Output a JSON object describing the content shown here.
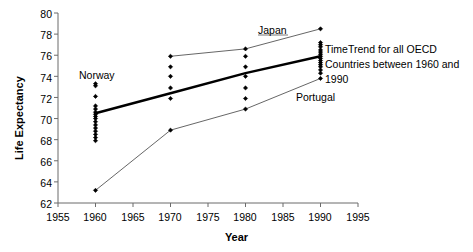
{
  "chart_data": {
    "type": "scatter",
    "title": "",
    "xlabel": "Year",
    "ylabel": "Life Expectancy",
    "xlim": [
      1955,
      1995
    ],
    "ylim": [
      62,
      80
    ],
    "xticks": [
      1955,
      1960,
      1965,
      1970,
      1975,
      1980,
      1985,
      1990,
      1995
    ],
    "yticks": [
      62,
      64,
      66,
      68,
      70,
      72,
      74,
      76,
      78,
      80
    ],
    "grid": false,
    "legend": "none",
    "annotations": [
      {
        "name": "japan",
        "text": "Japan",
        "x": 1985,
        "y": 78.6
      },
      {
        "name": "norway",
        "text": "Norway",
        "x": 1961,
        "y": 74.1
      },
      {
        "name": "portugal",
        "text": "Portugal",
        "x": 1988,
        "y": 72.2
      },
      {
        "name": "trend-note",
        "text": "TimeTrend for all OECD Countries between 1960 and 1990",
        "x": 1991,
        "y": 77.5
      }
    ],
    "series": [
      {
        "name": "OECD countries scatter",
        "type": "scatter",
        "marker": "diamond",
        "color": "#000000",
        "points": [
          {
            "x": 1960,
            "y": 73.3
          },
          {
            "x": 1960,
            "y": 73.1
          },
          {
            "x": 1960,
            "y": 72.1
          },
          {
            "x": 1960,
            "y": 71.2
          },
          {
            "x": 1960,
            "y": 70.9
          },
          {
            "x": 1960,
            "y": 70.6
          },
          {
            "x": 1960,
            "y": 70.4
          },
          {
            "x": 1960,
            "y": 70.2
          },
          {
            "x": 1960,
            "y": 70.0
          },
          {
            "x": 1960,
            "y": 69.7
          },
          {
            "x": 1960,
            "y": 69.4
          },
          {
            "x": 1960,
            "y": 69.1
          },
          {
            "x": 1960,
            "y": 68.8
          },
          {
            "x": 1960,
            "y": 68.5
          },
          {
            "x": 1960,
            "y": 68.2
          },
          {
            "x": 1960,
            "y": 67.9
          },
          {
            "x": 1960,
            "y": 63.2
          },
          {
            "x": 1970,
            "y": 75.9
          },
          {
            "x": 1970,
            "y": 74.9
          },
          {
            "x": 1970,
            "y": 74.0
          },
          {
            "x": 1970,
            "y": 72.9
          },
          {
            "x": 1970,
            "y": 71.9
          },
          {
            "x": 1970,
            "y": 68.9
          },
          {
            "x": 1980,
            "y": 76.6
          },
          {
            "x": 1980,
            "y": 75.9
          },
          {
            "x": 1980,
            "y": 74.9
          },
          {
            "x": 1980,
            "y": 74.0
          },
          {
            "x": 1980,
            "y": 72.9
          },
          {
            "x": 1980,
            "y": 71.9
          },
          {
            "x": 1980,
            "y": 70.9
          },
          {
            "x": 1990,
            "y": 78.5
          },
          {
            "x": 1990,
            "y": 77.2
          },
          {
            "x": 1990,
            "y": 77.0
          },
          {
            "x": 1990,
            "y": 76.8
          },
          {
            "x": 1990,
            "y": 76.5
          },
          {
            "x": 1990,
            "y": 76.3
          },
          {
            "x": 1990,
            "y": 76.1
          },
          {
            "x": 1990,
            "y": 75.9
          },
          {
            "x": 1990,
            "y": 75.7
          },
          {
            "x": 1990,
            "y": 75.5
          },
          {
            "x": 1990,
            "y": 75.3
          },
          {
            "x": 1990,
            "y": 75.1
          },
          {
            "x": 1990,
            "y": 74.9
          },
          {
            "x": 1990,
            "y": 74.6
          },
          {
            "x": 1990,
            "y": 74.3
          },
          {
            "x": 1990,
            "y": 73.8
          }
        ]
      },
      {
        "name": "Japan",
        "type": "line",
        "color": "#555555",
        "width": 0.9,
        "points": [
          {
            "x": 1970,
            "y": 75.9
          },
          {
            "x": 1980,
            "y": 76.6
          },
          {
            "x": 1990,
            "y": 78.5
          }
        ]
      },
      {
        "name": "Portugal",
        "type": "line",
        "color": "#555555",
        "width": 0.9,
        "points": [
          {
            "x": 1960,
            "y": 63.2
          },
          {
            "x": 1970,
            "y": 68.9
          },
          {
            "x": 1980,
            "y": 70.9
          },
          {
            "x": 1990,
            "y": 73.8
          }
        ]
      },
      {
        "name": "TimeTrend",
        "type": "line",
        "color": "#000000",
        "width": 2.4,
        "points": [
          {
            "x": 1960,
            "y": 70.5
          },
          {
            "x": 1970,
            "y": 72.4
          },
          {
            "x": 1980,
            "y": 74.3
          },
          {
            "x": 1990,
            "y": 75.9
          }
        ]
      }
    ]
  },
  "axes": {
    "ylabel": "Life Expectancy",
    "xlabel": "Year",
    "yticks": [
      "80",
      "78",
      "76",
      "74",
      "72",
      "70",
      "68",
      "66",
      "64",
      "62"
    ],
    "xticks": [
      "1955",
      "1960",
      "1965",
      "1970",
      "1975",
      "1980",
      "1985",
      "1990",
      "1995"
    ]
  },
  "annotations": {
    "japan": "Japan",
    "norway": "Norway",
    "portugal": "Portugal",
    "note": "TimeTrend for all OECD Countries between 1960 and 1990"
  }
}
